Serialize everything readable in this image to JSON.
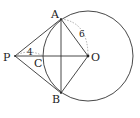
{
  "diagram": {
    "type": "geometry",
    "points": {
      "P": {
        "label": "P",
        "x": 15,
        "y": 56
      },
      "A": {
        "label": "A",
        "x": 61,
        "y": 19
      },
      "B": {
        "label": "B",
        "x": 61,
        "y": 93
      },
      "O": {
        "label": "O",
        "x": 88,
        "y": 56
      },
      "C": {
        "label": "C",
        "x": 43,
        "y": 56
      }
    },
    "circle": {
      "center": "O",
      "cx": 88,
      "cy": 56,
      "r": 45
    },
    "segments": [
      "PA",
      "PB",
      "PO",
      "AB",
      "AO",
      "BO"
    ],
    "measurements": {
      "PC": {
        "label": "4"
      },
      "AO": {
        "label": "6"
      }
    },
    "colors": {
      "stroke": "#333333",
      "dashed": "#888888",
      "text": "#222222"
    }
  }
}
